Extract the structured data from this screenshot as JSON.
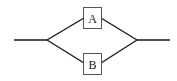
{
  "diagram": {
    "type": "parallel-system",
    "components": [
      {
        "id": "A",
        "label": "A",
        "branch": "upper"
      },
      {
        "id": "B",
        "label": "B",
        "branch": "lower"
      }
    ],
    "colors": {
      "line": "#1a1a1a",
      "box_border": "#555555",
      "background": "#ffffff"
    }
  }
}
